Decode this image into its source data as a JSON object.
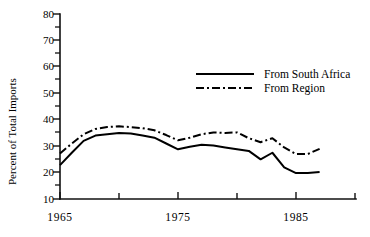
{
  "chart_data": {
    "type": "line",
    "title": "",
    "subtitle": "",
    "xlabel": "",
    "ylabel": "Percent of Total Imports",
    "xlim": [
      1965,
      1990
    ],
    "ylim": [
      10,
      80
    ],
    "yticks": [
      10,
      20,
      30,
      40,
      50,
      60,
      70,
      80
    ],
    "ytick_labels": [
      "10",
      "20",
      "30",
      "40",
      "50",
      "60",
      "70",
      "80"
    ],
    "xticks": [
      1965,
      1970,
      1975,
      1980,
      1985,
      1990
    ],
    "xtick_labels": [
      "1965",
      "",
      "1975",
      "",
      "1985",
      ""
    ],
    "xtick_labels_shown": [
      "1965",
      "1975",
      "1985"
    ],
    "grid": false,
    "legend_position": "upper right",
    "x": [
      1965,
      1966,
      1967,
      1968,
      1969,
      1970,
      1971,
      1972,
      1973,
      1974,
      1975,
      1976,
      1977,
      1978,
      1979,
      1980,
      1981,
      1982,
      1983,
      1984,
      1985,
      1986,
      1987
    ],
    "series": [
      {
        "name": "From South Africa",
        "style": "solid",
        "color": "#000000",
        "values": [
          22.8,
          27.5,
          32.0,
          34.0,
          34.5,
          35.0,
          34.8,
          34.0,
          33.2,
          31.0,
          28.8,
          29.8,
          30.5,
          30.2,
          29.5,
          28.8,
          28.2,
          25.0,
          27.5,
          22.0,
          19.8,
          19.8,
          20.2
        ]
      },
      {
        "name": "From Region",
        "style": "dash-dot",
        "color": "#000000",
        "values": [
          27.2,
          31.0,
          34.5,
          36.5,
          37.2,
          37.5,
          37.2,
          36.8,
          36.0,
          34.2,
          32.2,
          33.2,
          34.5,
          35.2,
          35.0,
          35.2,
          33.0,
          31.5,
          33.0,
          29.5,
          27.0,
          27.0,
          29.0
        ]
      }
    ]
  },
  "legend": {
    "entries": [
      {
        "label": "From South Africa",
        "style": "solid"
      },
      {
        "label": "From Region",
        "style": "dash-dot"
      }
    ]
  },
  "axes": {
    "ylabel": "Percent of Total Imports",
    "ytick_labels": [
      "80",
      "70",
      "60",
      "50",
      "40",
      "30",
      "20",
      "10"
    ],
    "xtick_labels": [
      "1965",
      "1975",
      "1985"
    ]
  }
}
